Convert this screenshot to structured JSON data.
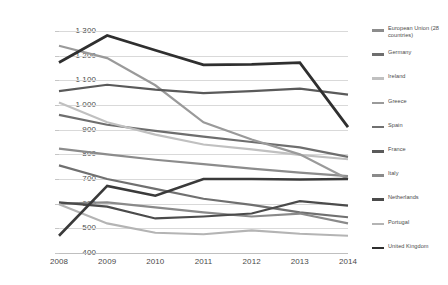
{
  "chart_data": {
    "type": "line",
    "title": "",
    "subtitle": "",
    "xlabel": "",
    "ylabel": "",
    "categories": [
      "2008",
      "2009",
      "2010",
      "2011",
      "2012",
      "2013",
      "2014"
    ],
    "x": [
      2008,
      2009,
      2010,
      2011,
      2012,
      2013,
      2014
    ],
    "ylim": [
      400,
      1300
    ],
    "ytick_values": [
      400,
      500,
      600,
      700,
      800,
      900,
      1000,
      1100,
      1200,
      1300
    ],
    "ytick_labels": [
      "400",
      "500",
      "600",
      "700",
      "800",
      "900",
      "1 000",
      "1 100",
      "1 200",
      "1 300"
    ],
    "grid": true,
    "legend_position": "right",
    "series": [
      {
        "name": "European Union (28 countries)",
        "color": "#8c8c8c",
        "width": 2.2,
        "values": [
          823,
          800,
          778,
          760,
          742,
          726,
          712
        ]
      },
      {
        "name": "Germany",
        "color": "#6e6e6e",
        "width": 2.2,
        "values": [
          960,
          920,
          895,
          872,
          850,
          828,
          790
        ]
      },
      {
        "name": "Ireland",
        "color": "#c0c0c0",
        "width": 2.2,
        "values": [
          1010,
          930,
          880,
          840,
          820,
          798,
          780
        ]
      },
      {
        "name": "Greece",
        "color": "#9a9a9a",
        "width": 2.2,
        "values": [
          1240,
          1190,
          1080,
          930,
          860,
          800,
          700
        ]
      },
      {
        "name": "Spain",
        "color": "#707070",
        "width": 2.2,
        "values": [
          755,
          700,
          660,
          620,
          595,
          565,
          545
        ]
      },
      {
        "name": "France",
        "color": "#5a5a5a",
        "width": 2.2,
        "values": [
          1056,
          1082,
          1062,
          1048,
          1056,
          1066,
          1042
        ]
      },
      {
        "name": "Italy",
        "color": "#8a8a8a",
        "width": 2.2,
        "values": [
          600,
          605,
          585,
          565,
          548,
          560,
          520
        ]
      },
      {
        "name": "Netherlands",
        "color": "#4b4b4b",
        "width": 2.2,
        "values": [
          605,
          588,
          540,
          548,
          560,
          610,
          592
        ]
      },
      {
        "name": "Portugal",
        "color": "#b4b4b4",
        "width": 2.2,
        "values": [
          598,
          520,
          482,
          476,
          492,
          478,
          470
        ]
      },
      {
        "name": "United Kingdom",
        "color": "#3a3a3a",
        "width": 2.6,
        "values": [
          470,
          672,
          632,
          700,
          700,
          698,
          700
        ]
      }
    ],
    "overlay_series": [
      {
        "name": "United Kingdom",
        "color": "#2f2f2f",
        "width": 2.8,
        "values": [
          1172,
          1282,
          1222,
          1163,
          1165,
          1172,
          910
        ]
      }
    ]
  },
  "legend": {
    "items": [
      {
        "label": "European Union (28 countries)",
        "color": "#8c8c8c"
      },
      {
        "label": "Germany",
        "color": "#6e6e6e"
      },
      {
        "label": "Ireland",
        "color": "#c0c0c0"
      },
      {
        "label": "Greece",
        "color": "#9a9a9a"
      },
      {
        "label": "Spain",
        "color": "#707070"
      },
      {
        "label": "France",
        "color": "#5a5a5a"
      },
      {
        "label": "Italy",
        "color": "#8a8a8a"
      },
      {
        "label": "Netherlands",
        "color": "#4b4b4b"
      },
      {
        "label": "Portugal",
        "color": "#b4b4b4"
      },
      {
        "label": "United Kingdom",
        "color": "#2f2f2f"
      }
    ]
  }
}
